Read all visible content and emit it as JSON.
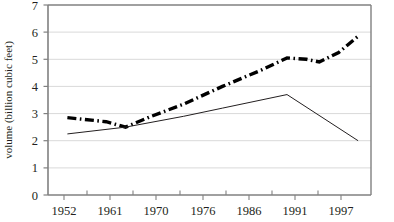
{
  "chart_data": {
    "type": "line",
    "title": "",
    "xlabel": "",
    "ylabel": "volume (billion cubic feet)",
    "x": [
      1952,
      1961,
      1970,
      1976,
      1986,
      1991,
      1997
    ],
    "xtick_labels": [
      "1952",
      "1961",
      "1970",
      "1976",
      "1986",
      "1991",
      "1997"
    ],
    "ytick_labels": [
      "0",
      "1",
      "2",
      "3",
      "4",
      "5",
      "6",
      "7"
    ],
    "ylim": [
      0,
      7
    ],
    "xlim": [
      1949,
      1999
    ],
    "grid": "horizontal",
    "legend": "none",
    "series": [
      {
        "name": "dash-dot-series",
        "style": "thick dash-dot",
        "color": "#000000",
        "x": [
          1952,
          1958,
          1961,
          1965,
          1970,
          1976,
          1982,
          1986,
          1989,
          1991,
          1994,
          1997
        ],
        "values": [
          2.85,
          2.7,
          2.5,
          2.9,
          3.35,
          4.0,
          4.6,
          5.05,
          5.0,
          4.9,
          5.25,
          5.85
        ]
      },
      {
        "name": "thin-solid-series",
        "style": "thin solid",
        "color": "#231f20",
        "x": [
          1952,
          1961,
          1970,
          1976,
          1986,
          1997
        ],
        "values": [
          2.25,
          2.5,
          2.9,
          3.2,
          3.7,
          2.0
        ]
      }
    ]
  },
  "axis": {
    "y_title": "volume (billion cubic feet)",
    "y_ticks": [
      "7",
      "6",
      "5",
      "4",
      "3",
      "2",
      "1",
      "0"
    ],
    "x_ticks": [
      "1952",
      "1961",
      "1970",
      "1976",
      "1986",
      "1991",
      "1997"
    ]
  },
  "colors": {
    "ink": "#231f20",
    "grid": "#d9d9d9",
    "axis": "#808080",
    "series_primary": "#000000",
    "series_secondary": "#231f20",
    "background": "#ffffff"
  }
}
